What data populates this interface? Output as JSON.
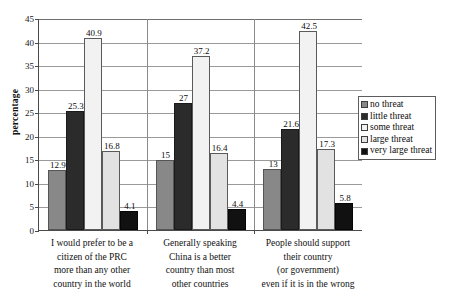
{
  "chart_data": {
    "type": "bar",
    "title": "",
    "xlabel": "",
    "ylabel": "percentage",
    "ylim": [
      0,
      45
    ],
    "yticks": [
      0,
      5,
      10,
      15,
      20,
      25,
      30,
      35,
      40,
      45
    ],
    "grid": true,
    "legend_position": "right",
    "categories": [
      "I would prefer to be a citizen of the PRC more than any other country in the world",
      "Generally speaking China is a better country than most other countries",
      "People should support their country (or government) even if it is in the wrong"
    ],
    "category_lines": [
      [
        "I would prefer to be a",
        "citizen of the PRC",
        "more than any other",
        "country in the world"
      ],
      [
        "Generally speaking",
        "China is a better",
        "country than most",
        "other countries"
      ],
      [
        "People should support",
        "their country",
        "(or government)",
        "even if it is in the wrong"
      ]
    ],
    "series": [
      {
        "name": "no threat",
        "color": "#888888",
        "values": [
          12.9,
          15,
          13
        ],
        "labels": [
          "12.9",
          "15",
          "13"
        ]
      },
      {
        "name": "little threat",
        "color": "#2b2b2b",
        "values": [
          25.3,
          27,
          21.6
        ],
        "labels": [
          "25.3",
          "27",
          "21.6"
        ]
      },
      {
        "name": "some threat",
        "color": "#f2f2f2",
        "values": [
          40.9,
          37.2,
          42.5
        ],
        "labels": [
          "40.9",
          "37.2",
          "42.5"
        ]
      },
      {
        "name": "large threat",
        "color": "#e2e2e2",
        "values": [
          16.8,
          16.4,
          17.3
        ],
        "labels": [
          "16.8",
          "16.4",
          "17.3"
        ]
      },
      {
        "name": "very large threat",
        "color": "#111111",
        "values": [
          4.1,
          4.4,
          5.8
        ],
        "labels": [
          "4.1",
          "4.4",
          "5.8"
        ]
      }
    ]
  }
}
